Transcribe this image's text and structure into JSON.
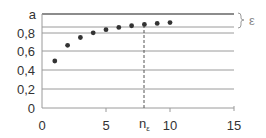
{
  "chart_data": {
    "type": "scatter",
    "title": "",
    "xlabel": "",
    "ylabel": "",
    "x": [
      1,
      2,
      3,
      4,
      5,
      6,
      7,
      8,
      9,
      10
    ],
    "values": [
      0.5,
      0.667,
      0.75,
      0.8,
      0.833,
      0.857,
      0.875,
      0.889,
      0.9,
      0.909
    ],
    "xlim": [
      0,
      15
    ],
    "ylim": [
      0,
      1.0
    ],
    "x_ticks": [
      "0",
      "5",
      "10",
      "15"
    ],
    "y_ticks": [
      "0",
      "0,2",
      "0,4",
      "0,6",
      "0,8"
    ],
    "grid": true,
    "annotations": {
      "limit_label": "a",
      "limit_value": 1.0,
      "epsilon_label": "ε",
      "epsilon_band_lower": 0.875,
      "n_epsilon_label": "n",
      "n_epsilon_subscript": "ε",
      "n_epsilon_x": 8
    }
  },
  "labels": {
    "y0": "0",
    "y02": "0,2",
    "y04": "0,4",
    "y06": "0,6",
    "y08": "0,8",
    "ya": "a",
    "x0": "0",
    "x5": "5",
    "x10": "10",
    "x15": "15",
    "eps": "ε",
    "n": "n",
    "n_sub": "ε"
  }
}
